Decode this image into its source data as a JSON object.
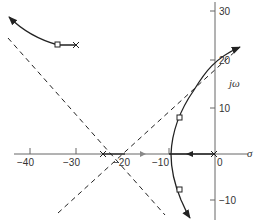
{
  "diagram": {
    "type": "root-locus",
    "colors": {
      "line": "#222222",
      "axis": "#555555",
      "text": "#333333",
      "background": "#ffffff"
    },
    "axes": {
      "real_label": "σ",
      "imag_label": "jω",
      "real_ticks": [
        {
          "value": -40,
          "label": "−40"
        },
        {
          "value": -30,
          "label": "−30"
        },
        {
          "value": -20,
          "label": "−20"
        },
        {
          "value": -10,
          "label": "−10"
        },
        {
          "value": 0,
          "label": "0"
        }
      ],
      "imag_ticks": [
        {
          "value": 30,
          "label": "30"
        },
        {
          "value": 20,
          "label": "20"
        },
        {
          "value": 10,
          "label": "10"
        },
        {
          "value": -10,
          "label": "−10"
        }
      ]
    },
    "poles": [
      {
        "sigma": 0,
        "omega": 0,
        "marker": "X"
      },
      {
        "sigma": -22,
        "omega": 0,
        "marker": "X"
      },
      {
        "sigma": -24,
        "omega": 24,
        "marker": "X"
      }
    ],
    "squares": [
      {
        "sigma": -34,
        "omega": 24
      },
      {
        "sigma": -8,
        "omega": 8
      },
      {
        "sigma": -8,
        "omega": -7
      }
    ],
    "asymptotes": "dashed lines crossing near σ = −21",
    "branches": [
      "from pole at (−24, 24) toward upper-left",
      "from pole at 0 along real axis to ≈ −10, then splits up/down",
      "upper branch toward (+2, 23)",
      "lower branch toward (−4, −14)"
    ]
  }
}
